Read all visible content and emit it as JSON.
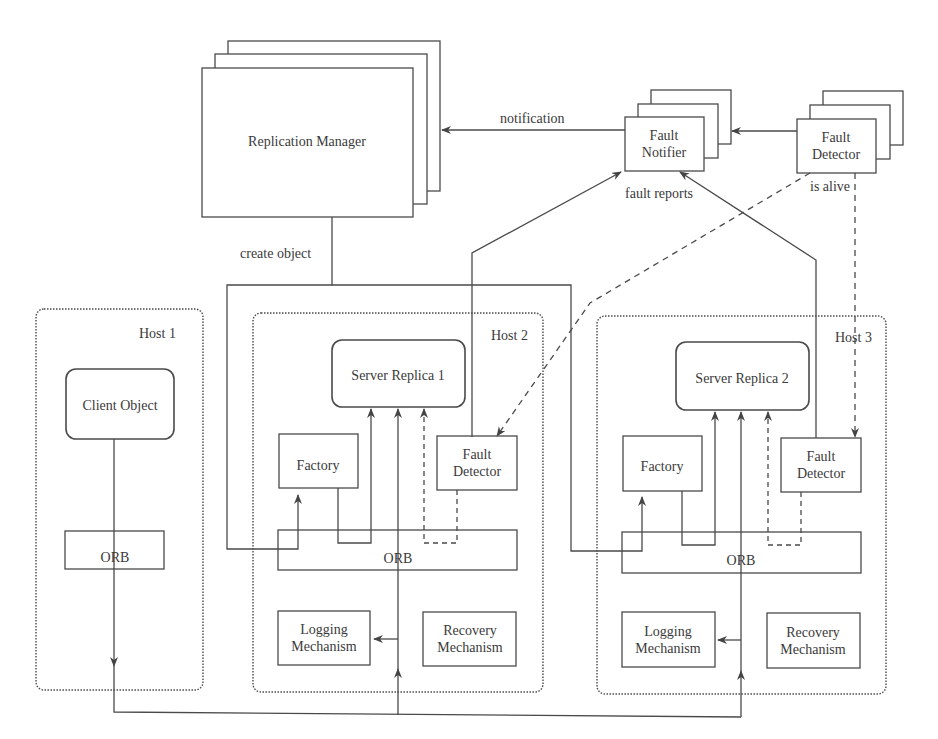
{
  "diagram": {
    "type": "architecture",
    "replication_manager": {
      "label": "Replication Manager"
    },
    "fault_notifier": {
      "line1": "Fault",
      "line2": "Notifier"
    },
    "global_fault_detector": {
      "line1": "Fault",
      "line2": "Detector"
    },
    "edges": {
      "notification": "notification",
      "fault_reports": "fault reports",
      "is_alive": "is alive",
      "create_object": "create object"
    },
    "hosts": [
      {
        "name": "Host 1",
        "client_object": "Client Object",
        "orb": "ORB"
      },
      {
        "name": "Host 2",
        "server_replica": "Server Replica 1",
        "factory": "Factory",
        "fault_detector": {
          "line1": "Fault",
          "line2": "Detector"
        },
        "orb": "ORB",
        "logging": {
          "line1": "Logging",
          "line2": "Mechanism"
        },
        "recovery": {
          "line1": "Recovery",
          "line2": "Mechanism"
        }
      },
      {
        "name": "Host 3",
        "server_replica": "Server Replica 2",
        "factory": "Factory",
        "fault_detector": {
          "line1": "Fault",
          "line2": "Detector"
        },
        "orb": "ORB",
        "logging": {
          "line1": "Logging",
          "line2": "Mechanism"
        },
        "recovery": {
          "line1": "Recovery",
          "line2": "Mechanism"
        }
      }
    ],
    "colors": {
      "stroke": "#4a4a4a",
      "text": "#3a3a3a",
      "background": "#ffffff"
    }
  }
}
